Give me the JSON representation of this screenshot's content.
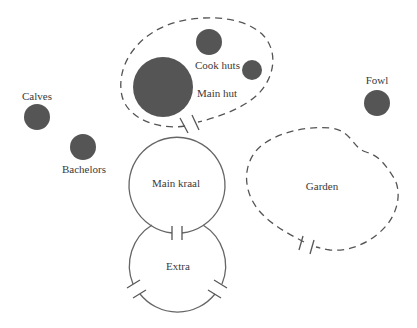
{
  "diagram": {
    "colors": {
      "background": "#ffffff",
      "hut_fill": "#555555",
      "line": "#555555",
      "text": "#3a3a3a"
    },
    "labels": {
      "cook_huts": "Cook huts",
      "main_hut": "Main hut",
      "calves": "Calves",
      "bachelors": "Bachelors",
      "fowl": "Fowl",
      "main_kraal": "Main kraal",
      "garden": "Garden",
      "extra": "Extra"
    },
    "nodes": [
      {
        "id": "main_hut",
        "label": "Main hut",
        "shape": "filled-circle",
        "cx": 163,
        "cy": 87,
        "r": 30
      },
      {
        "id": "cook_hut_1",
        "label": "Cook huts",
        "shape": "filled-circle",
        "cx": 209,
        "cy": 42,
        "r": 13
      },
      {
        "id": "cook_hut_2",
        "label": "Cook huts",
        "shape": "filled-circle",
        "cx": 252,
        "cy": 70,
        "r": 10
      },
      {
        "id": "calves",
        "label": "Calves",
        "shape": "filled-circle",
        "cx": 37,
        "cy": 117,
        "r": 13
      },
      {
        "id": "bachelors",
        "label": "Bachelors",
        "shape": "filled-circle",
        "cx": 83,
        "cy": 147,
        "r": 13
      },
      {
        "id": "fowl",
        "label": "Fowl",
        "shape": "filled-circle",
        "cx": 377,
        "cy": 103,
        "r": 13
      },
      {
        "id": "main_kraal",
        "label": "Main kraal",
        "shape": "open-circle",
        "cx": 177,
        "cy": 185,
        "r": 48
      },
      {
        "id": "extra",
        "label": "Extra",
        "shape": "open-circle",
        "cx": 178,
        "cy": 265,
        "r": 48
      },
      {
        "id": "hut_enclosure",
        "label": "",
        "shape": "dashed-outline"
      },
      {
        "id": "garden",
        "label": "Garden",
        "shape": "dashed-outline"
      }
    ],
    "gates": [
      {
        "between": "hut_enclosure",
        "x": 191,
        "y": 124
      },
      {
        "between": "main_kraal-extra",
        "x": 177,
        "y": 233
      },
      {
        "between": "extra-left",
        "x": 136,
        "y": 292
      },
      {
        "between": "extra-right",
        "x": 219,
        "y": 292
      },
      {
        "between": "garden",
        "x": 310,
        "y": 243
      }
    ]
  }
}
